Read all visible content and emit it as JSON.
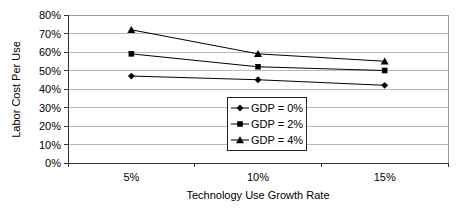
{
  "chart": {
    "background": "#ffffff",
    "plot_border_color": "#9a9a9a",
    "gridline_color": "#b8b8b8",
    "axis_color": "#333333",
    "series_color": "#000000",
    "text_color": "#000000"
  },
  "chart_data": {
    "type": "line",
    "categories": [
      "5%",
      "10%",
      "15%"
    ],
    "series": [
      {
        "name": "GDP = 0%",
        "marker": "diamond",
        "values": [
          47,
          45,
          42
        ]
      },
      {
        "name": "GDP = 2%",
        "marker": "square",
        "values": [
          59,
          52,
          50
        ]
      },
      {
        "name": "GDP = 4%",
        "marker": "triangle",
        "values": [
          72,
          59,
          55
        ]
      }
    ],
    "title": "",
    "xlabel": "Technology Use Growth Rate",
    "ylabel": "Labor Cost Per Use",
    "ylim": [
      0,
      80
    ],
    "ytick_step": 10,
    "ytick_format": "percent",
    "grid": true,
    "legend_position": "inside-bottom-center"
  }
}
